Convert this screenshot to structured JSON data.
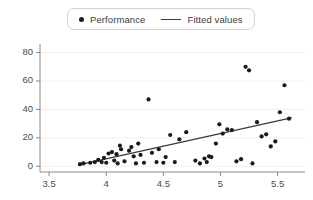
{
  "chart_data": {
    "type": "scatter",
    "title": "",
    "xlabel": "",
    "ylabel": "",
    "xlim": [
      3.42,
      5.74
    ],
    "ylim": [
      -4,
      86
    ],
    "grid": true,
    "legend_position": "top-center",
    "xticks": [
      "3.5",
      "4",
      "4.5",
      "5",
      "5.5"
    ],
    "xtick_values": [
      3.5,
      4,
      4.5,
      5,
      5.5
    ],
    "yticks": [
      "0",
      "20",
      "40",
      "60",
      "80"
    ],
    "ytick_values": [
      0,
      20,
      40,
      60,
      80
    ],
    "series": [
      {
        "name": "Performance",
        "type": "scatter",
        "marker": "circle",
        "color": "#1a1a1a",
        "points": [
          [
            3.77,
            1.5
          ],
          [
            3.8,
            2.0
          ],
          [
            3.86,
            2.5
          ],
          [
            3.9,
            3.0
          ],
          [
            3.93,
            4.5
          ],
          [
            3.96,
            3.0
          ],
          [
            3.98,
            6.0
          ],
          [
            4.0,
            2.5
          ],
          [
            4.02,
            9.0
          ],
          [
            4.05,
            10.0
          ],
          [
            4.07,
            4.0
          ],
          [
            4.09,
            8.5
          ],
          [
            4.1,
            2.0
          ],
          [
            4.12,
            14.5
          ],
          [
            4.13,
            12.0
          ],
          [
            4.16,
            3.5
          ],
          [
            4.2,
            11.0
          ],
          [
            4.22,
            13.5
          ],
          [
            4.24,
            7.0
          ],
          [
            4.26,
            2.0
          ],
          [
            4.28,
            16.0
          ],
          [
            4.3,
            8.0
          ],
          [
            4.33,
            2.5
          ],
          [
            4.37,
            47.0
          ],
          [
            4.4,
            9.5
          ],
          [
            4.44,
            3.0
          ],
          [
            4.46,
            12.0
          ],
          [
            4.5,
            2.5
          ],
          [
            4.52,
            6.5
          ],
          [
            4.56,
            22.0
          ],
          [
            4.6,
            3.0
          ],
          [
            4.64,
            19.0
          ],
          [
            4.7,
            24.0
          ],
          [
            4.78,
            4.0
          ],
          [
            4.82,
            2.0
          ],
          [
            4.86,
            5.5
          ],
          [
            4.88,
            3.0
          ],
          [
            4.9,
            7.0
          ],
          [
            4.92,
            6.5
          ],
          [
            4.96,
            16.0
          ],
          [
            4.99,
            29.5
          ],
          [
            5.02,
            23.0
          ],
          [
            5.06,
            26.0
          ],
          [
            5.1,
            25.5
          ],
          [
            5.14,
            3.5
          ],
          [
            5.18,
            5.0
          ],
          [
            5.22,
            70.0
          ],
          [
            5.25,
            67.5
          ],
          [
            5.28,
            2.0
          ],
          [
            5.32,
            31.0
          ],
          [
            5.36,
            21.0
          ],
          [
            5.4,
            22.5
          ],
          [
            5.44,
            14.0
          ],
          [
            5.48,
            17.5
          ],
          [
            5.52,
            38.0
          ],
          [
            5.56,
            57.0
          ],
          [
            5.6,
            33.5
          ]
        ]
      },
      {
        "name": "Fitted values",
        "type": "line",
        "color": "#3a3a3a",
        "endpoints": [
          [
            3.76,
            1.0
          ],
          [
            5.62,
            34.0
          ]
        ]
      }
    ],
    "legend": [
      {
        "label": "Performance",
        "marker": "dot",
        "color": "#1a1a1a"
      },
      {
        "label": "Fitted values",
        "marker": "line",
        "color": "#3a3a3a"
      }
    ],
    "axis_color": "#8a8a8a",
    "grid_color": "#f0f0f0"
  }
}
